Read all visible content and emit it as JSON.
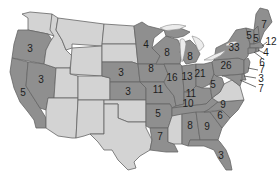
{
  "map": {
    "title": "United States electoral vote map",
    "colors": {
      "light": "#d3d3d3",
      "dark": "#8f8f8f",
      "border": "#666666",
      "lake": "#ececec"
    },
    "states": [
      {
        "id": "WA",
        "shade": "light",
        "value": ""
      },
      {
        "id": "OR",
        "shade": "dark",
        "value": "3"
      },
      {
        "id": "CA",
        "shade": "dark",
        "value": "5"
      },
      {
        "id": "NV",
        "shade": "dark",
        "value": "3"
      },
      {
        "id": "ID",
        "shade": "light",
        "value": ""
      },
      {
        "id": "MT",
        "shade": "light",
        "value": ""
      },
      {
        "id": "WY",
        "shade": "light",
        "value": ""
      },
      {
        "id": "UT",
        "shade": "light",
        "value": ""
      },
      {
        "id": "AZ",
        "shade": "light",
        "value": ""
      },
      {
        "id": "CO",
        "shade": "light",
        "value": ""
      },
      {
        "id": "NM",
        "shade": "light",
        "value": ""
      },
      {
        "id": "ND",
        "shade": "light",
        "value": ""
      },
      {
        "id": "SD",
        "shade": "light",
        "value": ""
      },
      {
        "id": "NE",
        "shade": "dark",
        "value": "3"
      },
      {
        "id": "KS",
        "shade": "dark",
        "value": "3"
      },
      {
        "id": "OK",
        "shade": "light",
        "value": ""
      },
      {
        "id": "TX",
        "shade": "light",
        "value": ""
      },
      {
        "id": "MN",
        "shade": "dark",
        "value": "4"
      },
      {
        "id": "IA",
        "shade": "dark",
        "value": "8"
      },
      {
        "id": "MO",
        "shade": "dark",
        "value": "11"
      },
      {
        "id": "AR",
        "shade": "dark",
        "value": "5"
      },
      {
        "id": "LA",
        "shade": "dark",
        "value": "7"
      },
      {
        "id": "WI",
        "shade": "dark",
        "value": "8"
      },
      {
        "id": "IL",
        "shade": "dark",
        "value": "16"
      },
      {
        "id": "MI",
        "shade": "dark",
        "value": "8"
      },
      {
        "id": "IN",
        "shade": "dark",
        "value": "13"
      },
      {
        "id": "OH",
        "shade": "dark",
        "value": "21"
      },
      {
        "id": "KY",
        "shade": "dark",
        "value": "11"
      },
      {
        "id": "TN",
        "shade": "dark",
        "value": "10"
      },
      {
        "id": "MS",
        "shade": "light",
        "value": ""
      },
      {
        "id": "AL",
        "shade": "dark",
        "value": "8"
      },
      {
        "id": "GA",
        "shade": "dark",
        "value": "9"
      },
      {
        "id": "FL",
        "shade": "dark",
        "value": "3"
      },
      {
        "id": "SC",
        "shade": "dark",
        "value": "6"
      },
      {
        "id": "NC",
        "shade": "dark",
        "value": "9"
      },
      {
        "id": "VA",
        "shade": "light",
        "value": ""
      },
      {
        "id": "WV",
        "shade": "dark",
        "value": "5"
      },
      {
        "id": "PA",
        "shade": "dark",
        "value": "26"
      },
      {
        "id": "NY",
        "shade": "dark",
        "value": "33"
      },
      {
        "id": "VT",
        "shade": "dark",
        "value": "5"
      },
      {
        "id": "NH",
        "shade": "dark",
        "value": "5"
      },
      {
        "id": "ME",
        "shade": "dark",
        "value": "7"
      },
      {
        "id": "MA",
        "shade": "dark",
        "value": "12"
      },
      {
        "id": "RI",
        "shade": "dark",
        "value": "4"
      },
      {
        "id": "CT",
        "shade": "dark",
        "value": "6"
      },
      {
        "id": "NJ",
        "shade": "dark",
        "value": "7"
      },
      {
        "id": "DE",
        "shade": "dark",
        "value": "3"
      },
      {
        "id": "MD",
        "shade": "dark",
        "value": "7"
      }
    ],
    "labels": {
      "OR": "3",
      "NV": "3",
      "CA": "5",
      "NE": "3",
      "KS": "3",
      "MN": "4",
      "IA": "8",
      "MO": "11",
      "AR": "5",
      "LA": "7",
      "WI": "8",
      "IL": "16",
      "MI": "8",
      "IN": "13",
      "OH": "21",
      "KY": "11",
      "TN": "10",
      "AL": "8",
      "GA": "9",
      "FL": "3",
      "SC": "6",
      "NC": "9",
      "WV": "5",
      "PA": "26",
      "NY": "33",
      "VT": "5",
      "NH": "5",
      "ME": "7",
      "MA": "12",
      "RI": "4",
      "CT": "6",
      "NJ": "7",
      "DE": "3",
      "MD": "7"
    }
  }
}
